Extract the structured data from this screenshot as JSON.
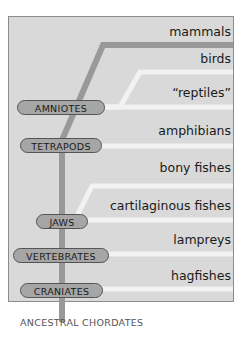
{
  "diagram": {
    "taxa": [
      "mammals",
      "birds",
      "“reptiles”",
      "amphibians",
      "bony fishes",
      "cartilaginous fishes",
      "lampreys",
      "hagfishes"
    ],
    "nodes": [
      "AMNIOTES",
      "TETRAPODS",
      "JAWS",
      "VERTEBRATES",
      "CRANIATES"
    ],
    "root_label": "ANCESTRAL CHORDATES",
    "colors": {
      "panel": "#d9d9d9",
      "trunk": "#999999",
      "branch": "#f2f2f2",
      "node_fill": "#a6a6a6"
    }
  }
}
